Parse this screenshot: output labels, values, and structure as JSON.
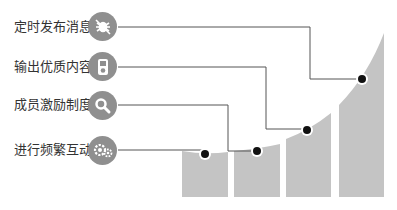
{
  "diagram": {
    "items": [
      {
        "label": "定时发布消息",
        "icon": "no-bug-icon",
        "dot": [
          362,
          79
        ]
      },
      {
        "label": "输出优质内容",
        "icon": "music-player-icon",
        "dot": [
          307,
          130
        ]
      },
      {
        "label": "成员激励制度",
        "icon": "search-icon",
        "dot": [
          257,
          151
        ]
      },
      {
        "label": "进行频繁互动",
        "icon": "gears-icon",
        "dot": [
          205,
          154
        ]
      }
    ],
    "colors": {
      "bar": "#c4c4c4",
      "icon_bg": "#8f8f8f",
      "line": "#555555",
      "dot": "#111111"
    }
  }
}
